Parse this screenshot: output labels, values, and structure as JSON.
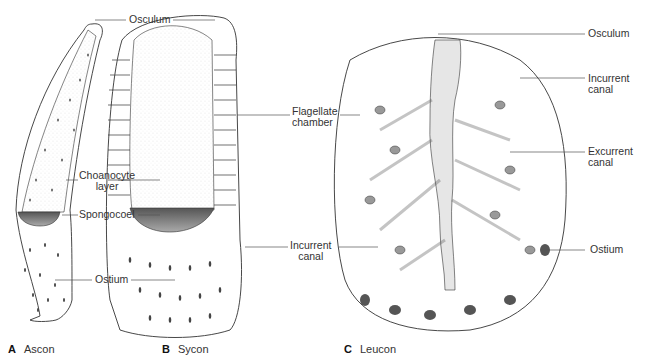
{
  "figure": {
    "panels": [
      {
        "letter": "A",
        "name": "Ascon"
      },
      {
        "letter": "B",
        "name": "Sycon"
      },
      {
        "letter": "C",
        "name": "Leucon"
      }
    ],
    "labels": {
      "ascon_osculum": "Osculum",
      "ascon_choanocyte_1": "Choanocyte",
      "ascon_choanocyte_2": "layer",
      "ascon_spongocoel": "Spongocoel",
      "ascon_ostium": "Ostium",
      "sycon_flagellate_1": "Flagellate",
      "sycon_flagellate_2": "chamber",
      "sycon_incurrent_1": "Incurrent",
      "sycon_incurrent_2": "canal",
      "leucon_osculum": "Osculum",
      "leucon_incurrent_1": "Incurrent",
      "leucon_incurrent_2": "canal",
      "leucon_excurrent_1": "Excurrent",
      "leucon_excurrent_2": "canal",
      "leucon_ostium": "Ostium"
    }
  }
}
